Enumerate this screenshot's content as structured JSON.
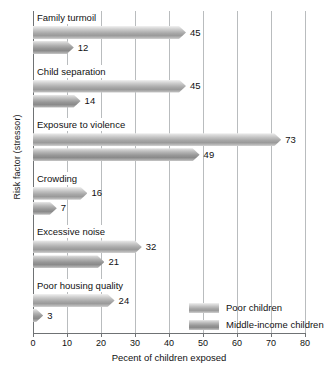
{
  "chart_data": {
    "type": "bar",
    "orientation": "horizontal",
    "title": "",
    "xlabel": "Pecent of children exposed",
    "ylabel": "Risk factor (stressor)",
    "xlim": [
      0,
      80
    ],
    "xticks": [
      0,
      10,
      20,
      30,
      40,
      50,
      60,
      70,
      80
    ],
    "grid": "vertical",
    "legend_position": "inside-bottom-right",
    "categories": [
      "Family turmoil",
      "Child separation",
      "Exposure to violence",
      "Crowding",
      "Excessive noise",
      "Poor housing quality"
    ],
    "series": [
      {
        "name": "Poor children",
        "values": [
          45,
          45,
          73,
          16,
          32,
          24
        ]
      },
      {
        "name": "Middle-income children",
        "values": [
          12,
          14,
          49,
          7,
          21,
          3
        ]
      }
    ]
  },
  "legend": {
    "items": [
      {
        "label": "Poor children"
      },
      {
        "label": "Middle-income children"
      }
    ]
  }
}
